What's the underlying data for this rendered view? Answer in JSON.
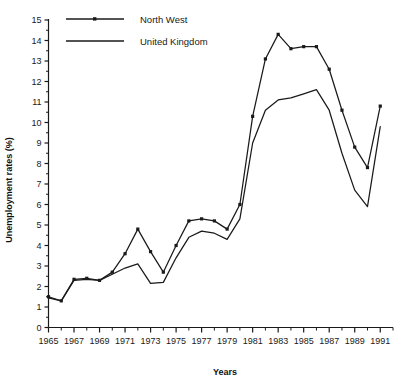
{
  "chart_data": {
    "type": "line",
    "title": "",
    "xlabel": "Years",
    "ylabel": "Unemployment rates (%)",
    "xlim": [
      1965,
      1992
    ],
    "ylim": [
      0,
      15
    ],
    "ytick_step": 1,
    "xtick_step": 2,
    "minor_xticks": true,
    "grid": false,
    "legend_position": "top-left-inside",
    "x": [
      1965,
      1966,
      1967,
      1968,
      1969,
      1970,
      1971,
      1972,
      1973,
      1974,
      1975,
      1976,
      1977,
      1978,
      1979,
      1980,
      1981,
      1982,
      1983,
      1984,
      1985,
      1986,
      1987,
      1988,
      1989,
      1990,
      1991
    ],
    "xtick_labels": [
      "1965",
      "1967",
      "1969",
      "1971",
      "1973",
      "1975",
      "1977",
      "1979",
      "1981",
      "1983",
      "1985",
      "1987",
      "1989",
      "1991"
    ],
    "ytick_labels": [
      "0",
      "1",
      "2",
      "3",
      "4",
      "5",
      "6",
      "7",
      "8",
      "9",
      "10",
      "11",
      "12",
      "13",
      "14",
      "15"
    ],
    "series": [
      {
        "name": "North West",
        "marker": "square-dot",
        "color": "#1a1a1a",
        "values": [
          1.5,
          1.3,
          2.35,
          2.4,
          2.3,
          2.7,
          3.6,
          4.8,
          3.7,
          2.7,
          4.0,
          5.2,
          5.3,
          5.2,
          4.8,
          6.0,
          10.3,
          13.1,
          14.3,
          13.6,
          13.7,
          13.7,
          12.6,
          10.6,
          8.8,
          7.8,
          10.8
        ],
        "legend_label": "North West"
      },
      {
        "name": "United Kingdom",
        "marker": "none",
        "color": "#1a1a1a",
        "values": [
          1.45,
          1.3,
          2.3,
          2.35,
          2.3,
          2.6,
          2.9,
          3.1,
          2.15,
          2.2,
          3.4,
          4.4,
          4.7,
          4.6,
          4.3,
          5.3,
          9.0,
          10.6,
          11.1,
          11.2,
          11.4,
          11.6,
          10.6,
          8.5,
          6.7,
          5.9,
          9.8
        ],
        "legend_label": "United Kingdom"
      }
    ]
  },
  "axis": {
    "x_title": "Years",
    "y_title": "Unemployment rates (%)"
  },
  "legend": {
    "items": [
      {
        "label": "North West"
      },
      {
        "label": "United Kingdom"
      }
    ]
  }
}
